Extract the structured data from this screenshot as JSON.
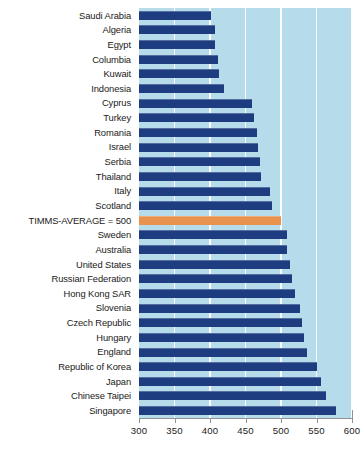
{
  "chart_data": {
    "type": "bar",
    "orientation": "horizontal",
    "title": "",
    "subtitle": "",
    "xlabel": "",
    "ylabel": "",
    "xlim": [
      300,
      600
    ],
    "xticks": [
      300,
      350,
      400,
      450,
      500,
      550,
      600
    ],
    "xtick_labels": [
      "300",
      "350",
      "400",
      "450",
      "500",
      "550",
      "600"
    ],
    "grid": "vertical-white-gridlines",
    "legend": "none",
    "bar_color": "#1e3c80",
    "highlight_color": "#e8924e",
    "plot_background": "#b6dbeb",
    "categories": [
      "Saudi Arabia",
      "Algeria",
      "Egypt",
      "Columbia",
      "Kuwait",
      "Indonesia",
      "Cyprus",
      "Turkey",
      "Romania",
      "Israel",
      "Serbia",
      "Thailand",
      "Italy",
      "Scotland",
      "TIMMS-AVERAGE = 500",
      "Sweden",
      "Australia",
      "United States",
      "Russian Federation",
      "Hong Kong SAR",
      "Slovenia",
      "Czech Republic",
      "Hungary",
      "England",
      "Republic of Korea",
      "Japan",
      "Chinese Taipei",
      "Singapore"
    ],
    "values": [
      401,
      407,
      407,
      411,
      413,
      420,
      459,
      462,
      466,
      468,
      471,
      472,
      484,
      487,
      500,
      508,
      509,
      512,
      516,
      520,
      527,
      530,
      532,
      537,
      551,
      556,
      564,
      577
    ],
    "highlight_category": "TIMMS-AVERAGE = 500",
    "highlight_index": 14
  }
}
